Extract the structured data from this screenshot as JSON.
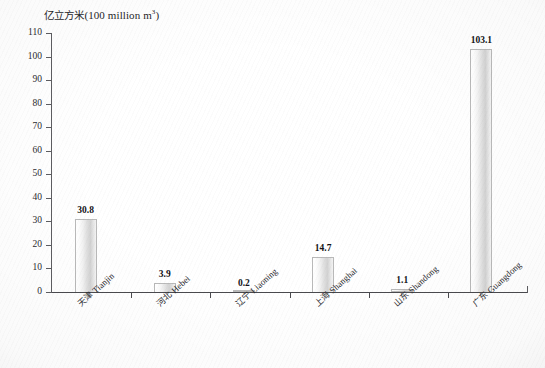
{
  "chart_data": {
    "type": "bar",
    "title_cn": "亿立方米",
    "title_unit": "(100 million m",
    "title_sup": "3",
    "title_close": ")",
    "xlabel": "",
    "ylabel": "亿立方米(100 million m³)",
    "ylim": [
      0,
      110
    ],
    "ytick_step": 10,
    "grid": false,
    "legend": "none",
    "categories": [
      "天津 Tianjin",
      "河北 Hebei",
      "辽宁 Liaoning",
      "上海 Shanghai",
      "山东 Shandong",
      "广东 Guangdong"
    ],
    "categories_cn": [
      "天津",
      "河北",
      "辽宁",
      "上海",
      "山东",
      "广东"
    ],
    "categories_en": [
      "Tianjin",
      "Hebei",
      "Liaoning",
      "Shanghai",
      "Shandong",
      "Guangdong"
    ],
    "values": [
      30.8,
      3.9,
      0.2,
      14.7,
      1.1,
      103.1
    ],
    "value_labels": [
      "30.8",
      "3.9",
      "0.2",
      "14.7",
      "1.1",
      "103.1"
    ],
    "ytick_labels": [
      "110",
      "100",
      "90",
      "80",
      "70",
      "60",
      "50",
      "40",
      "30",
      "20",
      "10",
      "0"
    ],
    "ytick_values": [
      110,
      100,
      90,
      80,
      70,
      60,
      50,
      40,
      30,
      20,
      10,
      0
    ],
    "colors": {
      "bar_fill_light": "#ffffff",
      "bar_fill_mid": "#d2d2d2",
      "bar_border": "#b9b9b9",
      "axis": "#4a4a4e",
      "text": "#2b2b2f",
      "value_text": "#131316",
      "background": "#ffffff"
    }
  }
}
